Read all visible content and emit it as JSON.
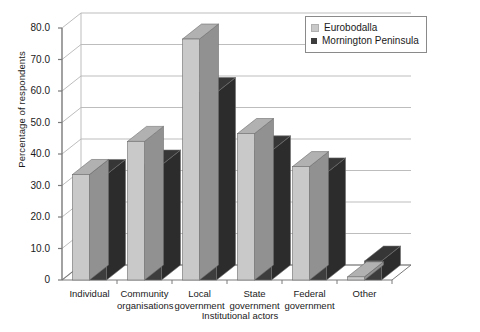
{
  "chart_data": {
    "type": "bar",
    "title": "",
    "subtitle": "",
    "xlabel": "Institutional actors",
    "ylabel": "Percentage of respondents",
    "categories": [
      "Individual",
      "Community\norganisations",
      "Local\ngovernment",
      "State\ngovernment",
      "Federal\ngovernment",
      "Other"
    ],
    "series": [
      {
        "name": "Eurobodalla",
        "color": "#c9c9c9",
        "values": [
          33.5,
          44.0,
          76.5,
          46.5,
          36.0,
          1.0
        ]
      },
      {
        "name": "Mornington Peninsula",
        "color": "#3d3d3d",
        "values": [
          33.5,
          36.5,
          59.5,
          41.0,
          34.0,
          6.0
        ]
      }
    ],
    "ylim": [
      0,
      80
    ],
    "yticks": [
      0,
      10,
      20,
      30,
      40,
      50,
      60,
      70,
      80
    ],
    "ytick_labels": [
      "0",
      "10.0",
      "20.0",
      "30.0",
      "40.0",
      "50.0",
      "60.0",
      "70.0",
      "80.0"
    ],
    "grid": true,
    "grid_axis": "y",
    "legend_position": "top-right",
    "style": "3d-column",
    "axis_color": "#7a7a7a",
    "grid_color": "#b5b5b5",
    "background": "#ffffff"
  },
  "legend": {
    "items": [
      {
        "label": "Eurobodalla",
        "color": "#c9c9c9"
      },
      {
        "label": "Mornington Peninsula",
        "color": "#3d3d3d"
      }
    ]
  },
  "axes": {
    "y_title": "Percentage of respondents",
    "x_title": "Institutional actors"
  }
}
